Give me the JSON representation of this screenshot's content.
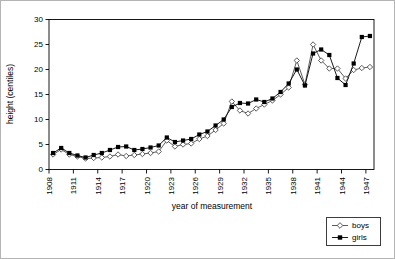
{
  "chart_data": {
    "type": "line",
    "xlabel": "year of measurement",
    "ylabel": "height (centiles)",
    "ylim": [
      0,
      30
    ],
    "yticks": [
      0,
      5,
      10,
      15,
      20,
      25,
      30
    ],
    "xtick_years": [
      1908,
      1911,
      1914,
      1917,
      1920,
      1923,
      1926,
      1929,
      1932,
      1935,
      1938,
      1941,
      1944,
      1947
    ],
    "x": [
      1908,
      1909,
      1910,
      1911,
      1912,
      1913,
      1914,
      1915,
      1916,
      1917,
      1918,
      1919,
      1920,
      1921,
      1922,
      1923,
      1924,
      1925,
      1926,
      1927,
      1928,
      1929,
      1930,
      1931,
      1932,
      1933,
      1934,
      1935,
      1936,
      1937,
      1938,
      1939,
      1940,
      1941,
      1942,
      1943,
      1944,
      1945,
      1946,
      1947
    ],
    "series": [
      {
        "name": "boys",
        "marker": "open-diamond",
        "color": "#4a4a4a",
        "values": [
          3.0,
          4.0,
          3.0,
          2.6,
          2.2,
          2.3,
          2.4,
          2.6,
          3.0,
          2.7,
          2.9,
          3.1,
          3.3,
          3.6,
          5.8,
          4.6,
          5.0,
          5.2,
          6.1,
          6.7,
          7.9,
          9.2,
          13.6,
          11.8,
          11.2,
          12.2,
          13.0,
          13.8,
          15.0,
          16.4,
          21.8,
          17.0,
          25.0,
          21.8,
          20.2,
          20.2,
          18.2,
          19.9,
          20.3,
          20.5
        ]
      },
      {
        "name": "girls",
        "marker": "filled-square",
        "color": "#000000",
        "values": [
          3.3,
          4.3,
          3.3,
          2.8,
          2.4,
          2.9,
          3.3,
          3.9,
          4.5,
          4.6,
          3.9,
          4.1,
          4.4,
          4.8,
          6.4,
          5.5,
          5.8,
          6.1,
          7.0,
          7.6,
          8.8,
          10.0,
          12.5,
          13.3,
          13.2,
          14.0,
          13.5,
          14.2,
          15.5,
          17.2,
          20.0,
          16.8,
          23.2,
          24.0,
          22.9,
          18.3,
          16.9,
          21.2,
          26.5,
          26.7
        ]
      }
    ],
    "grid": false,
    "legend_position": "bottom-right",
    "frame_color": "#000000"
  }
}
